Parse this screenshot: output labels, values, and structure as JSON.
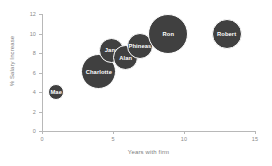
{
  "chart_data": {
    "type": "scatter",
    "variant": "bubble",
    "title": "",
    "xlabel": "Years with firm",
    "ylabel": "% Salary Increase",
    "xlim": [
      0,
      15
    ],
    "ylim": [
      0,
      12
    ],
    "xticks": [
      "0",
      "5",
      "10",
      "15"
    ],
    "xtick_values": [
      0,
      5,
      10,
      15
    ],
    "yticks": [
      "0",
      "2",
      "4",
      "6",
      "8",
      "10",
      "12"
    ],
    "ytick_values": [
      0,
      2,
      4,
      6,
      8,
      10,
      12
    ],
    "grid": false,
    "legend": "none",
    "bubble_color": "#404040",
    "bubble_border_color": "#ffffff",
    "axis_color": "#b8b8b8",
    "label_color": "#8a8a8a",
    "points": [
      {
        "label": "Mae",
        "x": 1.0,
        "y": 4.0,
        "size": 16
      },
      {
        "label": "Charlotte",
        "x": 4.0,
        "y": 6.1,
        "size": 35
      },
      {
        "label": "Jane",
        "x": 4.9,
        "y": 8.3,
        "size": 25
      },
      {
        "label": "Alan",
        "x": 5.9,
        "y": 7.5,
        "size": 25
      },
      {
        "label": "Phineas",
        "x": 6.9,
        "y": 8.7,
        "size": 26
      },
      {
        "label": "Ron",
        "x": 8.9,
        "y": 10.0,
        "size": 40
      },
      {
        "label": "Robert",
        "x": 13.0,
        "y": 10.0,
        "size": 30
      }
    ]
  }
}
